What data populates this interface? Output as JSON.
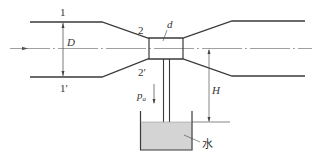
{
  "diagram": {
    "labels": {
      "section_1": "1",
      "section_1_prime": "1′",
      "section_2": "2",
      "section_2_prime": "2′",
      "diameter_pipe": "D",
      "diameter_throat": "d",
      "atmospheric_pressure": "p",
      "atmospheric_pressure_sub": "a",
      "height": "H",
      "water": "水"
    },
    "colors": {
      "line": "#3a3a3a",
      "water_fill": "#d4d4d4",
      "centerline": "#666666"
    }
  }
}
